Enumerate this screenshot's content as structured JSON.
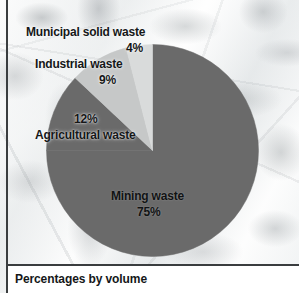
{
  "figure": {
    "caption": "Percentages by volume",
    "background": "#eef0f0",
    "rule_color": "#3a3d3f"
  },
  "chart_data": {
    "type": "pie",
    "title": "",
    "subtitle": "",
    "xlabel": "",
    "ylabel": "",
    "units": "percent by volume",
    "annotation": "Percentages by volume",
    "legend_position": "none",
    "labels_placement": "callout-and-inside",
    "start_angle_deg": 0,
    "direction": "clockwise",
    "categories": [
      "Mining waste",
      "Agricultural waste",
      "Industrial waste",
      "Municipal solid waste"
    ],
    "values": [
      75,
      12,
      9,
      4
    ],
    "value_labels": [
      "75%",
      "12%",
      "9%",
      "4%"
    ],
    "colors": [
      "#6a6a6a",
      "#6a6a6a",
      "#c6c8c8",
      "#d9dbdb"
    ],
    "slices": [
      {
        "name": "Mining waste",
        "value": 75,
        "value_label": "75%",
        "color": "#6a6a6a",
        "start_deg": 0,
        "end_deg": 270
      },
      {
        "name": "Agricultural waste",
        "value": 12,
        "value_label": "12%",
        "color": "#6a6a6a",
        "start_deg": 270,
        "end_deg": 313.2
      },
      {
        "name": "Industrial waste",
        "value": 9,
        "value_label": "9%",
        "color": "#c6c8c8",
        "start_deg": 313.2,
        "end_deg": 345.6
      },
      {
        "name": "Municipal solid waste",
        "value": 4,
        "value_label": "4%",
        "color": "#d9dbdb",
        "start_deg": 345.6,
        "end_deg": 360
      }
    ],
    "total": 100
  },
  "labels": {
    "municipal_name": "Municipal solid waste",
    "municipal_pct": "4%",
    "industrial_name": "Industrial waste",
    "industrial_pct": "9%",
    "agricultural_pct": "12%",
    "agricultural_name": "Agricultural waste",
    "mining_name": "Mining waste",
    "mining_pct": "75%"
  }
}
